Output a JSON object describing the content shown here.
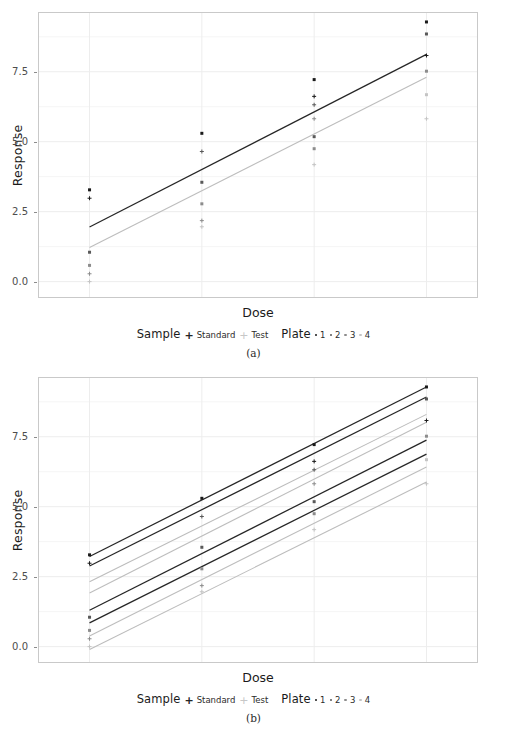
{
  "figure": {
    "background": "#ffffff",
    "panels": [
      {
        "caption": "(a)",
        "id": "panel-a"
      },
      {
        "caption": "(b)",
        "id": "panel-b"
      }
    ]
  },
  "axis": {
    "ylabel": "Response",
    "xlabel": "Dose",
    "yticks": [
      "0.0",
      "2.5",
      "5.0",
      "7.5"
    ],
    "ytick_values": [
      0.0,
      2.5,
      5.0,
      7.5
    ],
    "ylim": [
      -0.55,
      9.6
    ],
    "xlim": [
      -0.45,
      3.45
    ],
    "grid": "major and minor horizontal, light gray",
    "xtick_labels_shown": false
  },
  "legend": {
    "sample_title": "Sample",
    "sample_items": [
      {
        "label": "Standard",
        "glyph": "plus-bold",
        "color": "#262626"
      },
      {
        "label": "Test",
        "glyph": "plus-light",
        "color": "#b3b3b3"
      }
    ],
    "plate_title": "Plate",
    "plate_items": [
      {
        "label": "1",
        "glyph": "dot",
        "color": "#1a1a1a"
      },
      {
        "label": "2",
        "glyph": "dot",
        "color": "#595959"
      },
      {
        "label": "3",
        "glyph": "dot",
        "color": "#8c8c8c"
      },
      {
        "label": "4",
        "glyph": "dot",
        "color": "#c4c4c4"
      }
    ]
  },
  "colors": {
    "standard": "#262626",
    "test": "#bdbdbd",
    "plate1": "#1a1a1a",
    "plate2": "#595959",
    "plate3": "#8c8c8c",
    "plate4": "#c4c4c4",
    "panel_border": "#c9c9c9",
    "gridline_major": "#ededed",
    "gridline_minor": "#f5f5f5"
  },
  "chart_data": [
    {
      "type": "scatter",
      "id": "panel-a",
      "title": "",
      "xlabel": "Dose",
      "ylabel": "Response",
      "xlim": [
        -0.45,
        3.45
      ],
      "ylim": [
        -0.55,
        9.6
      ],
      "x": [
        0,
        1,
        2,
        3
      ],
      "grid": true,
      "legend_position": "bottom",
      "points": [
        {
          "sample": "Standard",
          "plate": 1,
          "x": 0,
          "y": 3.28
        },
        {
          "sample": "Standard",
          "plate": 2,
          "x": 0,
          "y": 1.05
        },
        {
          "sample": "Standard",
          "plate": 3,
          "x": 0,
          "y": 0.58
        },
        {
          "sample": "Test",
          "plate": 1,
          "x": 0,
          "y": 2.98
        },
        {
          "sample": "Test",
          "plate": 3,
          "x": 0,
          "y": 0.28
        },
        {
          "sample": "Test",
          "plate": 4,
          "x": 0,
          "y": 0.0
        },
        {
          "sample": "Standard",
          "plate": 1,
          "x": 1,
          "y": 5.3
        },
        {
          "sample": "Standard",
          "plate": 2,
          "x": 1,
          "y": 3.55
        },
        {
          "sample": "Standard",
          "plate": 3,
          "x": 1,
          "y": 2.78
        },
        {
          "sample": "Test",
          "plate": 2,
          "x": 1,
          "y": 4.65
        },
        {
          "sample": "Test",
          "plate": 3,
          "x": 1,
          "y": 2.18
        },
        {
          "sample": "Test",
          "plate": 4,
          "x": 1,
          "y": 1.96
        },
        {
          "sample": "Standard",
          "plate": 1,
          "x": 2,
          "y": 7.22
        },
        {
          "sample": "Standard",
          "plate": 2,
          "x": 2,
          "y": 5.18
        },
        {
          "sample": "Standard",
          "plate": 3,
          "x": 2,
          "y": 4.75
        },
        {
          "sample": "Test",
          "plate": 1,
          "x": 2,
          "y": 6.62
        },
        {
          "sample": "Test",
          "plate": 2,
          "x": 2,
          "y": 6.32
        },
        {
          "sample": "Test",
          "plate": 3,
          "x": 2,
          "y": 5.82
        },
        {
          "sample": "Test",
          "plate": 4,
          "x": 2,
          "y": 4.18
        },
        {
          "sample": "Standard",
          "plate": 1,
          "x": 3,
          "y": 9.28
        },
        {
          "sample": "Standard",
          "plate": 2,
          "x": 3,
          "y": 8.85
        },
        {
          "sample": "Standard",
          "plate": 3,
          "x": 3,
          "y": 7.52
        },
        {
          "sample": "Standard",
          "plate": 4,
          "x": 3,
          "y": 6.68
        },
        {
          "sample": "Test",
          "plate": 1,
          "x": 3,
          "y": 8.08
        },
        {
          "sample": "Test",
          "plate": 4,
          "x": 3,
          "y": 5.82
        }
      ],
      "lines": [
        {
          "name": "Standard (pooled)",
          "sample": "Standard",
          "color": "#262626",
          "x": [
            0,
            3
          ],
          "y": [
            1.95,
            8.12
          ]
        },
        {
          "name": "Test (pooled)",
          "sample": "Test",
          "color": "#bdbdbd",
          "x": [
            0,
            3
          ],
          "y": [
            1.22,
            7.3
          ]
        }
      ]
    },
    {
      "type": "scatter",
      "id": "panel-b",
      "title": "",
      "xlabel": "Dose",
      "ylabel": "Response",
      "xlim": [
        -0.45,
        3.45
      ],
      "ylim": [
        -0.55,
        9.6
      ],
      "x": [
        0,
        1,
        2,
        3
      ],
      "grid": true,
      "legend_position": "bottom",
      "points": [
        {
          "sample": "Standard",
          "plate": 1,
          "x": 0,
          "y": 3.28
        },
        {
          "sample": "Standard",
          "plate": 2,
          "x": 0,
          "y": 1.05
        },
        {
          "sample": "Standard",
          "plate": 3,
          "x": 0,
          "y": 0.58
        },
        {
          "sample": "Test",
          "plate": 1,
          "x": 0,
          "y": 2.98
        },
        {
          "sample": "Test",
          "plate": 3,
          "x": 0,
          "y": 0.28
        },
        {
          "sample": "Test",
          "plate": 4,
          "x": 0,
          "y": 0.0
        },
        {
          "sample": "Standard",
          "plate": 1,
          "x": 1,
          "y": 5.3
        },
        {
          "sample": "Standard",
          "plate": 2,
          "x": 1,
          "y": 3.55
        },
        {
          "sample": "Standard",
          "plate": 3,
          "x": 1,
          "y": 2.78
        },
        {
          "sample": "Test",
          "plate": 2,
          "x": 1,
          "y": 4.65
        },
        {
          "sample": "Test",
          "plate": 3,
          "x": 1,
          "y": 2.18
        },
        {
          "sample": "Test",
          "plate": 4,
          "x": 1,
          "y": 1.96
        },
        {
          "sample": "Standard",
          "plate": 1,
          "x": 2,
          "y": 7.22
        },
        {
          "sample": "Standard",
          "plate": 2,
          "x": 2,
          "y": 5.18
        },
        {
          "sample": "Standard",
          "plate": 3,
          "x": 2,
          "y": 4.75
        },
        {
          "sample": "Test",
          "plate": 1,
          "x": 2,
          "y": 6.62
        },
        {
          "sample": "Test",
          "plate": 2,
          "x": 2,
          "y": 6.32
        },
        {
          "sample": "Test",
          "plate": 3,
          "x": 2,
          "y": 5.82
        },
        {
          "sample": "Test",
          "plate": 4,
          "x": 2,
          "y": 4.18
        },
        {
          "sample": "Standard",
          "plate": 1,
          "x": 3,
          "y": 9.28
        },
        {
          "sample": "Standard",
          "plate": 2,
          "x": 3,
          "y": 8.85
        },
        {
          "sample": "Standard",
          "plate": 3,
          "x": 3,
          "y": 7.52
        },
        {
          "sample": "Standard",
          "plate": 4,
          "x": 3,
          "y": 6.68
        },
        {
          "sample": "Test",
          "plate": 1,
          "x": 3,
          "y": 8.08
        },
        {
          "sample": "Test",
          "plate": 4,
          "x": 3,
          "y": 5.82
        }
      ],
      "lines": [
        {
          "name": "Standard plate 1",
          "sample": "Standard",
          "plate": 1,
          "color": "#262626",
          "x": [
            0,
            3
          ],
          "y": [
            3.22,
            9.28
          ]
        },
        {
          "name": "Standard plate 2",
          "sample": "Standard",
          "plate": 2,
          "color": "#262626",
          "x": [
            0,
            3
          ],
          "y": [
            2.88,
            8.92
          ]
        },
        {
          "name": "Test plate 1",
          "sample": "Test",
          "plate": 1,
          "color": "#bdbdbd",
          "x": [
            0,
            3
          ],
          "y": [
            2.32,
            8.3
          ]
        },
        {
          "name": "Test plate 2",
          "sample": "Test",
          "plate": 2,
          "color": "#bdbdbd",
          "x": [
            0,
            3
          ],
          "y": [
            1.92,
            8.02
          ]
        },
        {
          "name": "Standard plate 3",
          "sample": "Standard",
          "plate": 3,
          "color": "#262626",
          "x": [
            0,
            3
          ],
          "y": [
            1.3,
            7.38
          ]
        },
        {
          "name": "Standard plate 4",
          "sample": "Standard",
          "plate": 4,
          "color": "#262626",
          "x": [
            0,
            3
          ],
          "y": [
            0.85,
            6.88
          ]
        },
        {
          "name": "Test plate 3",
          "sample": "Test",
          "plate": 3,
          "color": "#bdbdbd",
          "x": [
            0,
            3
          ],
          "y": [
            0.38,
            6.42
          ]
        },
        {
          "name": "Test plate 4",
          "sample": "Test",
          "plate": 4,
          "color": "#bdbdbd",
          "x": [
            0,
            3
          ],
          "y": [
            -0.1,
            5.88
          ]
        }
      ]
    }
  ]
}
